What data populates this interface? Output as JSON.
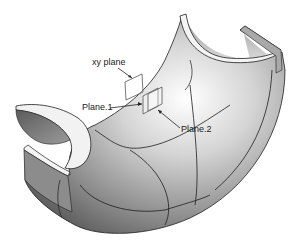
{
  "figure": {
    "labels": {
      "xy_plane": "xy plane",
      "plane1": "Plane.1",
      "plane2": "Plane.2"
    },
    "colors": {
      "background": "#ffffff",
      "surface_light": "#f2f2f2",
      "surface_mid": "#b8b8b8",
      "surface_dark": "#6e6e6e",
      "edge": "#1e1e1e",
      "plane_outline": "#555555"
    }
  }
}
